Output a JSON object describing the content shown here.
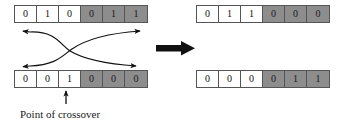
{
  "diagram": {
    "caption": "Point of crossover",
    "crossover_point_index": 3,
    "colors": {
      "shaded_cell": "#8d8d8d",
      "plain_cell": "#ffffff",
      "cell_border": "#555555",
      "arrow": "#111111",
      "text": "#111111"
    },
    "chromosomes": [
      {
        "id": "parent-1",
        "role": "parent",
        "position": "top-left",
        "genes": [
          "0",
          "1",
          "0",
          "0",
          "1",
          "1"
        ],
        "shading": [
          "plain",
          "plain",
          "plain",
          "shaded",
          "shaded",
          "shaded"
        ]
      },
      {
        "id": "parent-2",
        "role": "parent",
        "position": "bottom-left",
        "genes": [
          "0",
          "0",
          "1",
          "0",
          "0",
          "0"
        ],
        "shading": [
          "plain",
          "plain",
          "plain",
          "shaded",
          "shaded",
          "shaded"
        ]
      },
      {
        "id": "child-1",
        "role": "offspring",
        "position": "top-right",
        "genes": [
          "0",
          "1",
          "1",
          "0",
          "0",
          "0"
        ],
        "shading": [
          "plain",
          "plain",
          "plain",
          "shaded",
          "shaded",
          "shaded"
        ]
      },
      {
        "id": "child-2",
        "role": "offspring",
        "position": "bottom-right",
        "genes": [
          "0",
          "0",
          "0",
          "0",
          "1",
          "1"
        ],
        "shading": [
          "plain",
          "plain",
          "plain",
          "shaded",
          "shaded",
          "shaded"
        ]
      }
    ],
    "icons": {
      "transform_arrow": "thick-right-arrow",
      "swap_arrows": "crossing-double-arrows",
      "pointer": "up-arrow"
    }
  }
}
